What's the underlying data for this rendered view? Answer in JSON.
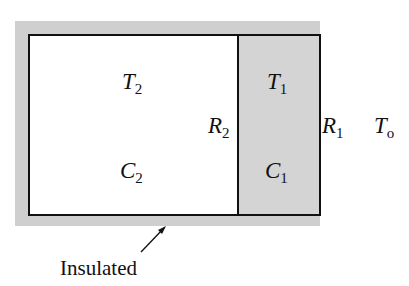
{
  "diagram": {
    "labels": {
      "T2": {
        "main": "T",
        "sub": "2"
      },
      "C2": {
        "main": "C",
        "sub": "2"
      },
      "R2": {
        "main": "R",
        "sub": "2"
      },
      "T1": {
        "main": "T",
        "sub": "1"
      },
      "C1": {
        "main": "C",
        "sub": "1"
      },
      "R1": {
        "main": "R",
        "sub": "1"
      },
      "To": {
        "main": "T",
        "sub": "o"
      }
    },
    "annotation": "Insulated",
    "colors": {
      "insulation": "#cfcfcf",
      "room1_fill": "#d4d4d4",
      "room2_fill": "#ffffff",
      "line": "#111111"
    }
  }
}
